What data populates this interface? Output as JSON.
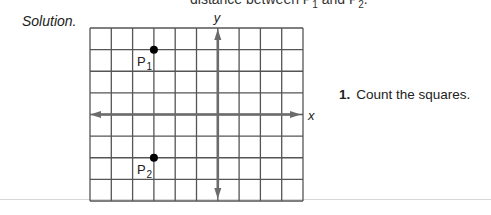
{
  "header": {
    "partial_text_prefix": "distance between ",
    "p1": "P",
    "p1_sub": "1",
    "and": " and ",
    "p2": "P",
    "p2_sub": "2",
    "period": "."
  },
  "solution": {
    "label": "Solution."
  },
  "steps": [
    {
      "number": "1.",
      "text": "Count the squares."
    }
  ],
  "graph": {
    "grid_columns": 10,
    "grid_rows": 8,
    "origin_column": 6,
    "origin_row": 4,
    "x_axis_label": "x",
    "y_axis_label": "y",
    "points": [
      {
        "name": "P",
        "sub": "1",
        "x": -3,
        "y": 3
      },
      {
        "name": "P",
        "sub": "2",
        "x": -3,
        "y": -2
      }
    ],
    "colors": {
      "grid": "#555555",
      "axis": "#6b6b6b",
      "point": "#000000"
    }
  }
}
